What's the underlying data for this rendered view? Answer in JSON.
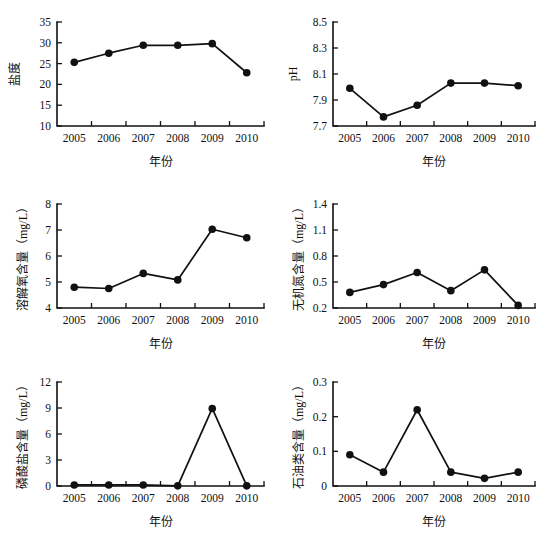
{
  "figure": {
    "background": "#ffffff",
    "ink_color": "#111111",
    "panel_count": 6,
    "x_axis_title": "年份",
    "categories": [
      "2005",
      "2006",
      "2007",
      "2008",
      "2009",
      "2010"
    ]
  },
  "chart_data": [
    {
      "id": "salinity",
      "type": "line",
      "title": "",
      "xlabel": "年份",
      "ylabel": "盐度",
      "categories": [
        "2005",
        "2006",
        "2007",
        "2008",
        "2009",
        "2010"
      ],
      "values": [
        25.3,
        27.5,
        29.4,
        29.4,
        29.8,
        22.8
      ],
      "ylim": [
        10,
        35
      ],
      "yticks": [
        10,
        15,
        20,
        25,
        30,
        35
      ],
      "ytick_labels": [
        "10",
        "15",
        "20",
        "25",
        "30",
        "35"
      ],
      "grid": false,
      "legend": "none",
      "marker": "filled-circle"
    },
    {
      "id": "ph",
      "type": "line",
      "title": "",
      "xlabel": "年份",
      "ylabel": "pH",
      "categories": [
        "2005",
        "2006",
        "2007",
        "2008",
        "2009",
        "2010"
      ],
      "values": [
        7.99,
        7.77,
        7.86,
        8.03,
        8.03,
        8.01
      ],
      "ylim": [
        7.7,
        8.5
      ],
      "yticks": [
        7.7,
        7.9,
        8.1,
        8.3,
        8.5
      ],
      "ytick_labels": [
        "7.7",
        "7.9",
        "8.1",
        "8.3",
        "8.5"
      ],
      "grid": false,
      "legend": "none",
      "marker": "filled-circle"
    },
    {
      "id": "dissolved-oxygen",
      "type": "line",
      "title": "",
      "xlabel": "年份",
      "ylabel": "溶解氧含量（mg/L）",
      "categories": [
        "2005",
        "2006",
        "2007",
        "2008",
        "2009",
        "2010"
      ],
      "values": [
        4.8,
        4.75,
        5.33,
        5.08,
        7.03,
        6.7
      ],
      "ylim": [
        4,
        8
      ],
      "yticks": [
        4,
        5,
        6,
        7,
        8
      ],
      "ytick_labels": [
        "4",
        "5",
        "6",
        "7",
        "8"
      ],
      "grid": false,
      "legend": "none",
      "marker": "filled-circle"
    },
    {
      "id": "inorganic-nitrogen",
      "type": "line",
      "title": "",
      "xlabel": "年份",
      "ylabel": "无机氮含量（mg/L）",
      "categories": [
        "2005",
        "2006",
        "2007",
        "2008",
        "2009",
        "2010"
      ],
      "values": [
        0.38,
        0.47,
        0.61,
        0.4,
        0.64,
        0.23
      ],
      "ylim": [
        0.2,
        1.4
      ],
      "yticks": [
        0.2,
        0.5,
        0.8,
        1.1,
        1.4
      ],
      "ytick_labels": [
        "0.2",
        "0.5",
        "0.8",
        "1.1",
        "1.4"
      ],
      "grid": false,
      "legend": "none",
      "marker": "filled-circle"
    },
    {
      "id": "phosphate",
      "type": "line",
      "title": "",
      "xlabel": "年份",
      "ylabel": "磷酸盐含量（mg/L）",
      "categories": [
        "2005",
        "2006",
        "2007",
        "2008",
        "2009",
        "2010"
      ],
      "values": [
        0.12,
        0.12,
        0.12,
        0.02,
        8.95,
        0.02
      ],
      "ylim": [
        0,
        12
      ],
      "yticks": [
        0,
        3,
        6,
        9,
        12
      ],
      "ytick_labels": [
        "0",
        "3",
        "6",
        "9",
        "12"
      ],
      "grid": false,
      "legend": "none",
      "marker": "filled-circle"
    },
    {
      "id": "petroleum",
      "type": "line",
      "title": "",
      "xlabel": "年份",
      "ylabel": "石油类含量（mg/L）",
      "categories": [
        "2005",
        "2006",
        "2007",
        "2008",
        "2009",
        "2010"
      ],
      "values": [
        0.09,
        0.04,
        0.22,
        0.04,
        0.022,
        0.04
      ],
      "ylim": [
        0,
        0.3
      ],
      "yticks": [
        0,
        0.1,
        0.2,
        0.3
      ],
      "ytick_labels": [
        "0",
        "0.1",
        "0.2",
        "0.3"
      ],
      "grid": false,
      "legend": "none",
      "marker": "filled-circle"
    }
  ]
}
